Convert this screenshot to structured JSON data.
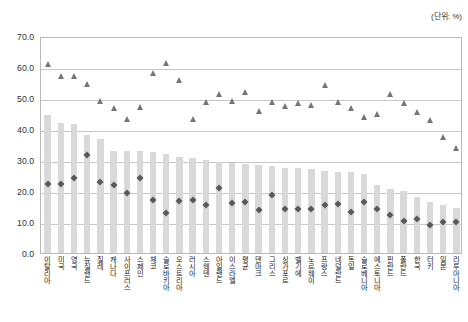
{
  "unit_note": "(단위: %)",
  "chart_data": {
    "type": "bar",
    "title": "",
    "subtitle": "",
    "xlabel": "",
    "ylabel": "",
    "ylim": [
      0.0,
      70.0
    ],
    "ytick_labels": [
      "0.0",
      "10.0",
      "20.0",
      "30.0",
      "40.0",
      "50.0",
      "60.0",
      "70.0"
    ],
    "ytick_values": [
      0.0,
      10.0,
      20.0,
      30.0,
      40.0,
      50.0,
      60.0,
      70.0
    ],
    "grid": true,
    "legend_position": "none",
    "legend": [],
    "annotations": [
      "(단위: %)"
    ],
    "categories": [
      "이탈리아",
      "미국",
      "영국",
      "뉴질랜드",
      "칠레",
      "캐나다",
      "사이프러스",
      "스페인",
      "체코",
      "슬로바키아",
      "오스트리아",
      "러시아",
      "스웨덴",
      "아일랜드",
      "이스라엘",
      "평균",
      "덴마크",
      "그리스",
      "싱가포르",
      "벨기에",
      "노르웨이",
      "프랑스",
      "네덜란드",
      "독일",
      "슬로베니아",
      "에스토니아",
      "핀란드",
      "폴란드",
      "한국",
      "터키",
      "일본",
      "리투아니아"
    ],
    "series": [
      {
        "name": "막대",
        "type": "bar",
        "color": "#d9d9d9",
        "values": [
          44.5,
          42.0,
          41.5,
          38.0,
          36.8,
          33.0,
          33.0,
          33.0,
          32.5,
          32.0,
          31.0,
          30.5,
          30.0,
          29.5,
          29.0,
          28.8,
          28.5,
          28.0,
          27.5,
          27.5,
          27.0,
          26.5,
          26.0,
          26.0,
          25.5,
          22.0,
          20.5,
          20.0,
          18.0,
          16.5,
          15.5,
          14.5
        ]
      },
      {
        "name": "마름모",
        "type": "scatter",
        "marker": "diamond",
        "color": "#595959",
        "values": [
          22.8,
          23.0,
          25.0,
          32.2,
          23.5,
          22.5,
          20.0,
          24.8,
          17.8,
          13.5,
          17.5,
          17.8,
          16.0,
          21.5,
          16.8,
          17.0,
          14.5,
          19.5,
          15.0,
          14.8,
          15.0,
          16.0,
          16.5,
          13.8,
          17.0,
          15.0,
          13.0,
          11.0,
          11.5,
          9.8,
          10.5,
          10.8
        ]
      },
      {
        "name": "삼각형",
        "type": "scatter",
        "marker": "triangle",
        "color": "#767676",
        "values": [
          61.5,
          57.8,
          57.8,
          55.3,
          49.8,
          47.5,
          43.8,
          47.8,
          58.8,
          61.8,
          56.3,
          43.8,
          49.5,
          52.0,
          49.8,
          52.5,
          46.5,
          49.5,
          48.0,
          49.0,
          48.5,
          55.0,
          49.5,
          47.5,
          44.5,
          45.5,
          52.0,
          49.0,
          46.0,
          43.5,
          38.0,
          34.5
        ]
      }
    ]
  }
}
